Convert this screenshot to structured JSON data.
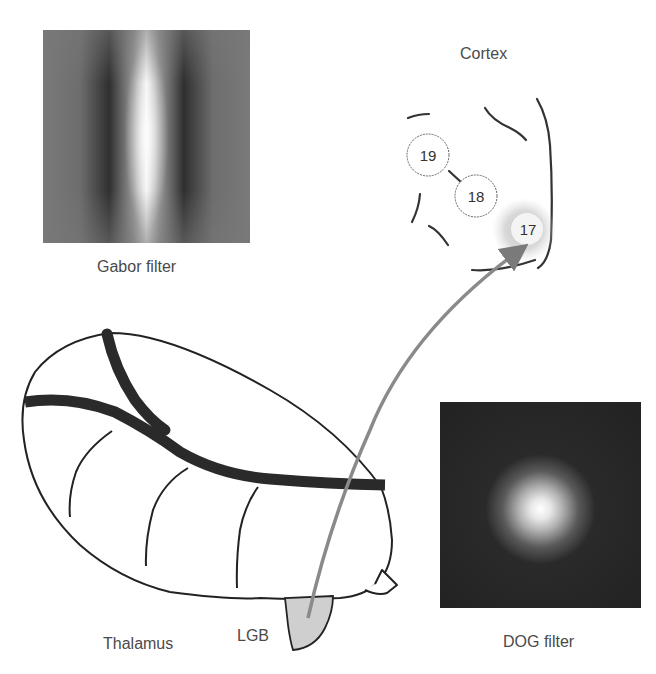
{
  "figure": {
    "gabor": {
      "label": "Gabor filter"
    },
    "dog": {
      "label": "DOG filter"
    },
    "cortex": {
      "label": "Cortex",
      "areas": [
        {
          "id": "19",
          "label": "19"
        },
        {
          "id": "18",
          "label": "18"
        },
        {
          "id": "17",
          "label": "17"
        }
      ]
    },
    "thalamus": {
      "label": "Thalamus"
    },
    "lgb": {
      "label": "LGB"
    },
    "colors": {
      "outline": "#222222",
      "arrow": "#8a8a8a",
      "lgb_fill": "#cfcfcf",
      "halo": "#bdbdbd"
    }
  }
}
